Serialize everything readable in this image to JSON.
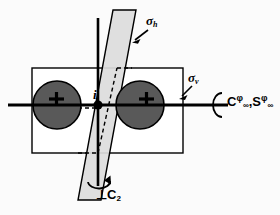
{
  "figure": {
    "background_color": "#fbfbfb",
    "line_color": "#000000",
    "atom_fill_color": "#595959",
    "plane_fill_color": "#dcdcdc",
    "rectangle_fill_color": "#ffffff"
  },
  "labels": {
    "sigma_h": "σh",
    "sigma_h_symbol": "σ",
    "sigma_h_sub": "h",
    "sigma_v_symbol": "σ",
    "sigma_v_sub": "v",
    "inversion_center": "i",
    "perpendicular_c2": "⊥C2",
    "perpendicular_c2_prefix": "⊥C",
    "perpendicular_c2_sub": "2",
    "rotation_axis": "C∞φ,S∞φ",
    "rotation_c": "C",
    "rotation_s": "S",
    "rotation_comma": ",",
    "infinity": "∞",
    "phi": "φ"
  },
  "atoms": [
    {
      "name": "left-atom",
      "charge": "+",
      "cx": 57,
      "cy": 105,
      "r": 24
    },
    {
      "name": "right-atom",
      "charge": "+",
      "cx": 140,
      "cy": 105,
      "r": 24
    }
  ],
  "elements": {
    "inversion_point": {
      "cx": 98,
      "cy": 105,
      "r": 4
    },
    "sigma_v_rectangle": {
      "x": 32,
      "y": 68,
      "width": 151,
      "height": 85
    },
    "sigma_h_parallelogram": "78,200 101,200 136,10 113,10",
    "principal_axis": {
      "x1": 8,
      "y1": 105,
      "x2": 228,
      "y2": 105
    },
    "c2_axis": {
      "x1": 98,
      "y1": 18,
      "x2": 98,
      "y2": 186
    }
  }
}
